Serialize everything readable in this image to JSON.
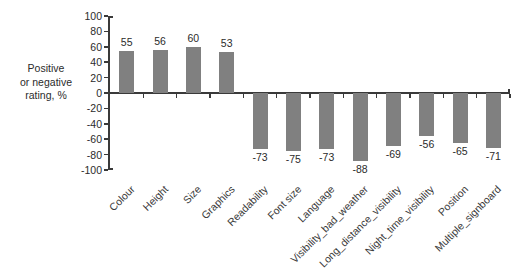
{
  "chart_data": {
    "type": "bar",
    "title": "",
    "subtitle": "",
    "xlabel": "",
    "ylabel": "Positive or negative rating, %",
    "ylabel_lines": [
      "Positive",
      "or negative",
      "rating, %"
    ],
    "ylim": [
      -100,
      100
    ],
    "ytick_step": 20,
    "yticks": [
      100,
      80,
      60,
      40,
      20,
      0,
      -20,
      -40,
      -60,
      -80,
      -100
    ],
    "ytick_labels": [
      "100",
      "80",
      "60",
      "40",
      "20",
      "0",
      "-20",
      "-40",
      "-60",
      "-80",
      "-100"
    ],
    "grid": false,
    "legend": "none",
    "bar_color": "#808080",
    "axis_color": "#3a3a3a",
    "background_color": "#ffffff",
    "categories": [
      "Colour",
      "Height",
      "Size",
      "Graphics",
      "Readability",
      "Font size",
      "Language",
      "Visibility_bad_weather",
      "Long_distance_visibility",
      "Night_time_visibility",
      "Position",
      "Multiple_signboard"
    ],
    "values": [
      55,
      56,
      60,
      53,
      -73,
      -75,
      -73,
      -88,
      -69,
      -56,
      -65,
      -71
    ],
    "value_labels": [
      "55",
      "56",
      "60",
      "53",
      "-73",
      "-75",
      "-73",
      "-88",
      "-69",
      "-56",
      "-65",
      "-71"
    ]
  }
}
